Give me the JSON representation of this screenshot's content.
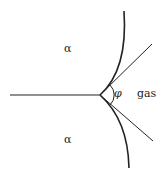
{
  "diagram": {
    "title": "",
    "labels": {
      "alpha_top": "α",
      "alpha_bottom": "α",
      "phi": "φ",
      "gas": "gas"
    },
    "colors": {
      "stroke": "#222222",
      "background": "#ffffff"
    }
  }
}
